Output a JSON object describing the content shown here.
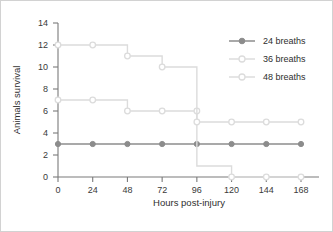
{
  "chart_data": {
    "type": "line",
    "subtype": "step-kaplan-meier",
    "title": "",
    "xlabel": "Hours post-injury",
    "ylabel": "Animals survival",
    "x": [
      0,
      24,
      48,
      72,
      96,
      120,
      144,
      168
    ],
    "xticklabels": [
      "0",
      "24",
      "48",
      "72",
      "96",
      "120",
      "144",
      "168"
    ],
    "yticklabels": [
      "0",
      "2",
      "4",
      "6",
      "8",
      "10",
      "12",
      "14"
    ],
    "yticks": [
      0,
      2,
      4,
      6,
      8,
      10,
      12,
      14
    ],
    "xlim": [
      0,
      168
    ],
    "ylim": [
      0,
      14
    ],
    "grid": false,
    "legend_position": "top-right",
    "series": [
      {
        "name": "24 breaths",
        "values": [
          3,
          3,
          3,
          3,
          3,
          3,
          3,
          3
        ],
        "color": "#8c8c8c",
        "marker": "filled-circle"
      },
      {
        "name": "36 breaths",
        "values": [
          7,
          7,
          6,
          6,
          6,
          0,
          0,
          0
        ],
        "step_values": [
          7,
          7,
          6,
          6,
          1,
          0,
          0,
          0
        ],
        "color": "#dcdcdc",
        "marker": "open-circle"
      },
      {
        "name": "48 breaths",
        "values": [
          12,
          12,
          11,
          10,
          5,
          5,
          5,
          5
        ],
        "step_values": [
          12,
          12,
          11,
          10,
          5,
          5,
          5,
          5
        ],
        "color": "#dcdcdc",
        "marker": "open-circle"
      }
    ]
  },
  "legend": {
    "entries": [
      {
        "label": "24 breaths"
      },
      {
        "label": "36 breaths"
      },
      {
        "label": "48 breaths"
      }
    ]
  },
  "axes": {
    "x_title": "Hours post-injury",
    "y_title": "Animals survival"
  },
  "colors": {
    "series_24": "#8c8c8c",
    "series_36": "#dcdcdc",
    "series_48": "#dcdcdc",
    "axis": "#7a7a7a",
    "text": "#2e2e2e",
    "frame": "#d2d2d2",
    "background": "#ffffff"
  }
}
